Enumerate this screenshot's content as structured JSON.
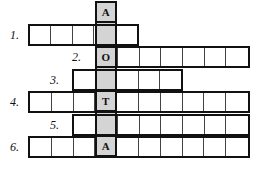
{
  "puzzle": {
    "type": "crossword-acrostic",
    "cell_width": 22.2,
    "cell_height": 22.3,
    "grid_origin_x": 28,
    "grid_origin_y": 24,
    "keyword_column_index": 3,
    "keyword": {
      "letters": [
        "A",
        "",
        "O",
        "",
        "T",
        "",
        "A"
      ],
      "visible_letters": [
        "A",
        "O",
        "T",
        "A"
      ],
      "length": 7,
      "highlight_color": "#d4d4d4",
      "border_color": "#111111",
      "top_y": 1,
      "rows": 7
    },
    "line_color": "#111111",
    "inner_line_color": "#444444",
    "background": "#ffffff",
    "rows": [
      {
        "number": "1.",
        "label_position": "left",
        "start_col": 0,
        "cells": 5,
        "y": 24,
        "values": [
          "",
          "",
          "",
          "",
          ""
        ],
        "label_x": 10,
        "label_y": 29
      },
      {
        "number": "2.",
        "label_position": "inline",
        "start_col": 3,
        "cells": 7,
        "y": 46,
        "values": [
          "",
          "",
          "",
          "",
          "",
          "",
          ""
        ],
        "label_x": 72,
        "label_y": 51
      },
      {
        "number": "3.",
        "label_position": "inline",
        "start_col": 2,
        "cells": 5,
        "y": 69,
        "values": [
          "",
          "",
          "",
          "",
          ""
        ],
        "label_x": 50,
        "label_y": 74
      },
      {
        "number": "4.",
        "label_position": "left",
        "start_col": 0,
        "cells": 10,
        "y": 91,
        "values": [
          "",
          "",
          "",
          "",
          "",
          "",
          "",
          "",
          "",
          ""
        ],
        "label_x": 10,
        "label_y": 96
      },
      {
        "number": "5.",
        "label_position": "inline",
        "start_col": 2,
        "cells": 8,
        "y": 114,
        "values": [
          "",
          "",
          "",
          "",
          "",
          "",
          "",
          ""
        ],
        "label_x": 50,
        "label_y": 119
      },
      {
        "number": "6.",
        "label_position": "left",
        "start_col": 0,
        "cells": 10,
        "y": 136,
        "values": [
          "",
          "",
          "",
          "",
          "",
          "",
          "",
          "",
          "",
          ""
        ],
        "label_x": 10,
        "label_y": 141
      }
    ]
  }
}
